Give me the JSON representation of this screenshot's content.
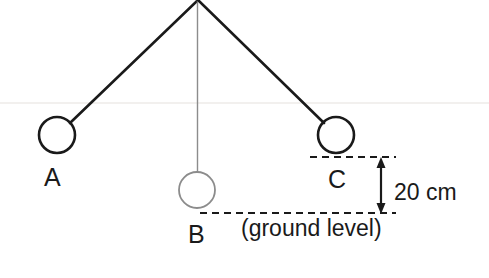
{
  "diagram": {
    "background_color": "#ffffff",
    "stroke_color": "#1a1a1a",
    "light_stroke_color": "#8c8c8c",
    "pivot": {
      "x": 198,
      "y": 0
    },
    "bobs": [
      {
        "id": "A",
        "label": "A",
        "cx": 57,
        "cy": 135,
        "r": 18,
        "stroke": "#1a1a1a",
        "stroke_width": 2.6,
        "string_stroke": "#1a1a1a",
        "string_width": 2.6
      },
      {
        "id": "B",
        "label": "B",
        "cx": 197,
        "cy": 190,
        "r": 18,
        "stroke": "#8c8c8c",
        "stroke_width": 1.7,
        "string_stroke": "#8c8c8c",
        "string_width": 1.3
      },
      {
        "id": "C",
        "label": "C",
        "cx": 336,
        "cy": 135,
        "r": 18,
        "stroke": "#1a1a1a",
        "stroke_width": 2.6,
        "string_stroke": "#1a1a1a",
        "string_width": 2.6
      }
    ],
    "reference_lines": [
      {
        "name": "upper-dashed-line",
        "x1": 310,
        "y1": 157,
        "x2": 396,
        "y2": 157,
        "dash": "7 5"
      },
      {
        "name": "ground-dashed-line",
        "x1": 200,
        "y1": 213,
        "x2": 396,
        "y2": 213,
        "dash": "7 5"
      }
    ],
    "dimension": {
      "name": "height-dimension",
      "x": 381,
      "y_top": 158,
      "y_bottom": 213,
      "value": "20 cm"
    },
    "ground_label": "(ground level)",
    "faint_artifact_line": {
      "y": 103,
      "x1": 0,
      "x2": 489,
      "color": "#f2f0ee"
    }
  }
}
